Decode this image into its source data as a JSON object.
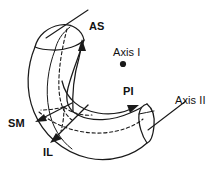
{
  "figure": {
    "type": "anatomical-line-diagram",
    "background_color": "#ffffff",
    "line_color": "#1a1a1a"
  },
  "labels": {
    "as": {
      "text": "AS",
      "name": "label-as",
      "x": 89,
      "y": 21
    },
    "axis_one": {
      "text": "Axis I",
      "name": "label-axis-i",
      "x": 113,
      "y": 47
    },
    "pi": {
      "text": "PI",
      "name": "label-pi",
      "x": 123,
      "y": 86
    },
    "axis_two": {
      "text": "Axis II",
      "name": "label-axis-ii",
      "x": 175,
      "y": 95
    },
    "sm": {
      "text": "SM",
      "name": "label-sm",
      "x": 8,
      "y": 118
    },
    "il": {
      "text": "IL",
      "name": "label-il",
      "x": 43,
      "y": 147
    }
  },
  "markers": {
    "axis_one_point": {
      "name": "axis-i-point-marker",
      "cx": 123,
      "cy": 64,
      "r": 3.1,
      "color": "#1a1a1a"
    }
  },
  "annotations": {
    "as_leader": "straight line from upper cap of the structure extending up-right to the AS label",
    "axis_two_leader": "straight line from the lower-right end face extending up-right to the Axis II label",
    "pi_arrow": "curved arrow sweeping rightward along the inner lower border toward PI",
    "as_arrow": "curved arrow sweeping upward along the inner border toward AS",
    "sm_arrow": "straight arrow pointing down-left out of the structure toward SM",
    "il_arrow": "straight arrow pointing down-left out of the structure toward IL"
  }
}
